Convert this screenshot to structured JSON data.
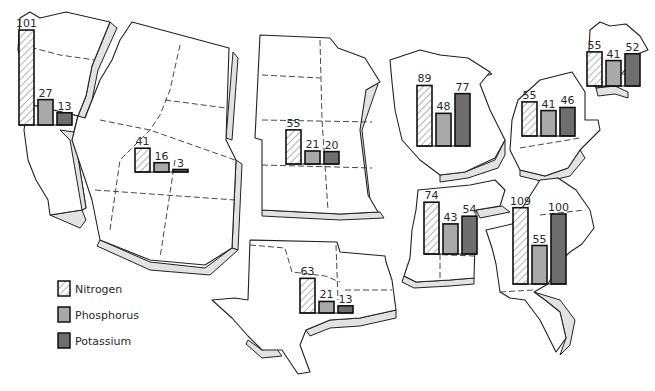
{
  "chart_data": {
    "type": "bar",
    "title": "",
    "xlabel": "",
    "ylabel": "",
    "grid": false,
    "legend_position": "bottom-left",
    "series_names": [
      "Nitrogen",
      "Phosphorus",
      "Potassium"
    ],
    "categories": [
      "Pacific",
      "Mountain",
      "Northern Plains",
      "Southern Plains",
      "Lake States",
      "Corn Belt/Appalachian",
      "Northeast",
      "Delta States",
      "Southeast"
    ],
    "series": [
      {
        "name": "Nitrogen",
        "values": [
          101,
          41,
          55,
          63,
          89,
          55,
          55,
          74,
          109
        ]
      },
      {
        "name": "Phosphorus",
        "values": [
          27,
          16,
          21,
          21,
          48,
          41,
          41,
          43,
          55
        ]
      },
      {
        "name": "Potassium",
        "values": [
          13,
          3,
          20,
          13,
          77,
          46,
          52,
          54,
          100
        ]
      }
    ],
    "colors": {
      "nitrogen": "#ffffff",
      "nitrogen_hatch": "#8a8a8a",
      "phosphorus": "#a9a9a9",
      "potassium": "#6e6e6e"
    }
  },
  "legend": {
    "items": [
      {
        "label": "Nitrogen",
        "swatch": "hatched"
      },
      {
        "label": "Phosphorus",
        "swatch": "light-gray"
      },
      {
        "label": "Potassium",
        "swatch": "dark-gray"
      }
    ]
  },
  "regions": [
    {
      "id": "pacific",
      "x": 19,
      "base": 125,
      "scale": 0.94,
      "values": [
        101,
        27,
        13
      ],
      "labels": [
        "101",
        "27",
        "13"
      ]
    },
    {
      "id": "mountain",
      "x": 135,
      "base": 172,
      "scale": 0.58,
      "values": [
        41,
        16,
        3
      ],
      "labels": [
        "41",
        "16",
        "3"
      ]
    },
    {
      "id": "northern-plains",
      "x": 286,
      "base": 164,
      "scale": 0.62,
      "values": [
        55,
        21,
        20
      ],
      "labels": [
        "55",
        "21",
        "20"
      ]
    },
    {
      "id": "southern-plains",
      "x": 300,
      "base": 313,
      "scale": 0.55,
      "values": [
        63,
        21,
        13
      ],
      "labels": [
        "63",
        "21",
        "13"
      ]
    },
    {
      "id": "lake-states",
      "x": 417,
      "base": 146,
      "scale": 0.68,
      "values": [
        89,
        48,
        77
      ],
      "labels": [
        "89",
        "48",
        "77"
      ]
    },
    {
      "id": "corn-belt",
      "x": 522,
      "base": 136,
      "scale": 0.62,
      "values": [
        55,
        41,
        46
      ],
      "labels": [
        "55",
        "41",
        "46"
      ]
    },
    {
      "id": "northeast",
      "x": 587,
      "base": 86,
      "scale": 0.62,
      "values": [
        55,
        41,
        52
      ],
      "labels": [
        "55",
        "41",
        "52"
      ]
    },
    {
      "id": "delta-states",
      "x": 424,
      "base": 254,
      "scale": 0.7,
      "values": [
        74,
        43,
        54
      ],
      "labels": [
        "74",
        "43",
        "54"
      ]
    },
    {
      "id": "southeast",
      "x": 513,
      "base": 284,
      "scale": 0.7,
      "values": [
        109,
        55,
        100
      ],
      "labels": [
        "109",
        "55",
        "100"
      ]
    }
  ]
}
